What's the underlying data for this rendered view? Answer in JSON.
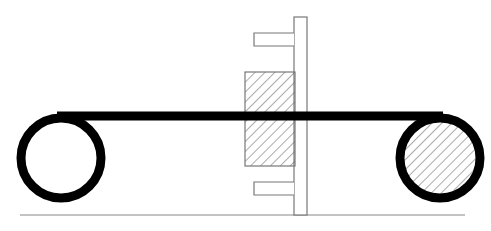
{
  "diagram": {
    "colors": {
      "background": "#ffffff",
      "belt": "#000000",
      "outline": "#777777",
      "hatch": "#555555"
    },
    "components": {
      "left_pulley": {
        "cx": 61,
        "cy": 158,
        "r": 40,
        "stroke": 9,
        "filled": false
      },
      "right_pulley": {
        "cx": 440,
        "cy": 158,
        "r": 40,
        "stroke": 9,
        "filled": true
      },
      "belt": {
        "x1": 57,
        "x2": 443,
        "y": 116,
        "thickness": 9
      },
      "hatched_block": {
        "x": 245,
        "y": 72,
        "w": 50,
        "h": 94
      },
      "vertical_post": {
        "x": 294,
        "y": 17,
        "w": 13,
        "h": 198
      },
      "top_flange": {
        "x": 254,
        "y": 33,
        "w": 40,
        "h": 13
      },
      "bottom_flange": {
        "x": 254,
        "y": 182,
        "w": 40,
        "h": 13
      },
      "ground_line": {
        "x1": 20,
        "x2": 465,
        "y": 215
      }
    }
  }
}
